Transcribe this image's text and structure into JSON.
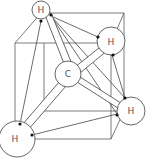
{
  "diagram": {
    "atoms": [
      {
        "id": "H_top",
        "label": "H",
        "cx": 41,
        "cy": 10,
        "r": 9
      },
      {
        "id": "H_right_top",
        "label": "H",
        "cx": 111,
        "cy": 41,
        "r": 14
      },
      {
        "id": "C_center",
        "label": "C",
        "cx": 68,
        "cy": 74,
        "r": 13
      },
      {
        "id": "H_right_low",
        "label": "H",
        "cx": 131,
        "cy": 111,
        "r": 14
      },
      {
        "id": "H_bottom_left",
        "label": "H",
        "cx": 17,
        "cy": 139,
        "r": 18
      }
    ],
    "colors": {
      "line": "#5a5a5a",
      "dot": "#111111",
      "fill": "#ffffff"
    }
  }
}
